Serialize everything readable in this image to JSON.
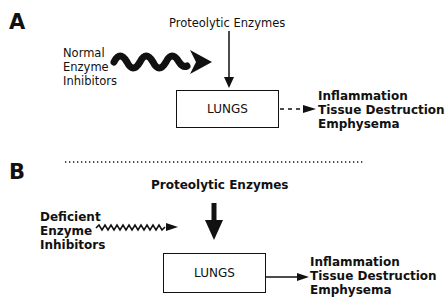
{
  "panel_a": {
    "letter": "A",
    "enzymes_label": "Proteolytic Enzymes",
    "inhibitors_label": [
      "Normal",
      "Enzyme",
      "Inhibitors"
    ],
    "organ_label": "LUNGS",
    "outcomes": [
      "Inflammation",
      "Tissue Destruction",
      "Emphysema"
    ],
    "outcome_arrow_style": "dashed"
  },
  "panel_b": {
    "letter": "B",
    "enzymes_label": "Proteolytic Enzymes",
    "inhibitors_label": [
      "Deficient",
      "Enzyme",
      "Inhibitors"
    ],
    "organ_label": "LUNGS",
    "outcomes": [
      "Inflammation",
      "Tissue Destruction",
      "Emphysema"
    ],
    "outcome_arrow_style": "solid"
  }
}
